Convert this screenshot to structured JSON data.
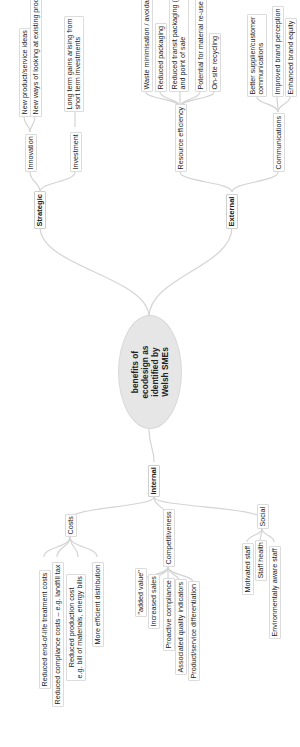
{
  "diagram": {
    "type": "mind-map",
    "orientation": "rotated -90deg",
    "root": {
      "lines": [
        "benefits of",
        "ecodesign as",
        "identified by",
        "Welsh SMEs"
      ]
    },
    "branches": {
      "strategic": {
        "label": "Strategic",
        "children": [
          {
            "label": "Innovation",
            "items": [
              "New product/service ideas",
              "New ways of looking at existing products/services"
            ]
          },
          {
            "label": "Investment",
            "items": [
              "Long term gains arising from",
              "short term investments"
            ]
          }
        ]
      },
      "external": {
        "label": "External",
        "children": [
          {
            "label": "Resource efficiency",
            "items": [
              "Waste minimisation / avoidance",
              "Reduced packaging",
              "Reduced transit packaging (in/out)",
              "and point of sale",
              "Potential for material re-use",
              "On-site recycling"
            ]
          },
          {
            "label": "Communications",
            "items": [
              "Better supplier/customer",
              "communications",
              "Improved brand perception",
              "Enhanced brand equity"
            ]
          }
        ]
      },
      "internal": {
        "label": "Internal",
        "children": [
          {
            "label": "Costs",
            "items": [
              "Reduced end-of-life treatment costs",
              "Reduced compliance costs – e.g. landfill tax",
              "Reduced production cost",
              "e.g. bill of materials, energy bills",
              "More efficient distribution"
            ]
          },
          {
            "label": "Competitiveness",
            "items": [
              "\"added value\"",
              "Increased sales",
              "Proactive compliance",
              "Associated quality indicators",
              "Product/service differentiation"
            ]
          },
          {
            "label": "Social",
            "items": [
              "Motivated staff",
              "Staff health",
              "Environmentally aware staff"
            ]
          }
        ]
      }
    },
    "colors": {
      "root_fill": "#e6e6e6",
      "link": "#d4d4d4",
      "node_border": "#dcdcdc"
    }
  }
}
